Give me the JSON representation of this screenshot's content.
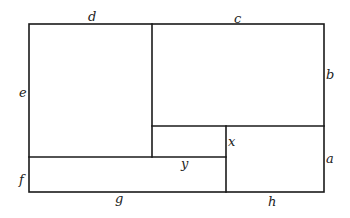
{
  "diagram": {
    "type": "rectangle-partition",
    "stroke_color": "#1a1a1a",
    "background": "#ffffff",
    "outer_rect": {
      "x": 29,
      "y": 24,
      "w": 295,
      "h": 168
    },
    "lines": [
      {
        "id": "divider-d-c",
        "x1": 152,
        "y1": 24,
        "x2": 152,
        "y2": 157
      },
      {
        "id": "bottom-of-bc",
        "x1": 152,
        "y1": 126,
        "x2": 324,
        "y2": 126
      },
      {
        "id": "top-of-fg",
        "x1": 29,
        "y1": 157,
        "x2": 226,
        "y2": 157
      },
      {
        "id": "divider-x-a",
        "x1": 226,
        "y1": 126,
        "x2": 226,
        "y2": 192
      }
    ],
    "labels": [
      {
        "id": "d",
        "text": "d",
        "x": 88,
        "y": 21
      },
      {
        "id": "c",
        "text": "c",
        "x": 234,
        "y": 23
      },
      {
        "id": "b",
        "text": "b",
        "x": 326,
        "y": 79
      },
      {
        "id": "e",
        "text": "e",
        "x": 19,
        "y": 97
      },
      {
        "id": "x",
        "text": "x",
        "x": 228,
        "y": 146
      },
      {
        "id": "y",
        "text": "y",
        "x": 181,
        "y": 168
      },
      {
        "id": "a",
        "text": "a",
        "x": 326,
        "y": 163
      },
      {
        "id": "f",
        "text": "f",
        "x": 19,
        "y": 184
      },
      {
        "id": "g",
        "text": "g",
        "x": 115,
        "y": 203
      },
      {
        "id": "h",
        "text": "h",
        "x": 268,
        "y": 206
      }
    ]
  }
}
